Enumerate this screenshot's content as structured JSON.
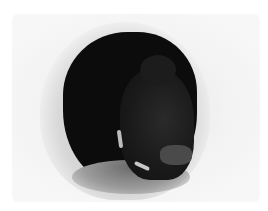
{
  "image": {
    "description": "Snow cave entrance with a dark interior and a person crouched inside",
    "colors": {
      "background": "#ffffff",
      "snow": "#f2f2f2",
      "snow_shadow": "#c8c8c8",
      "cave_interior": "#0c0c0c",
      "figure": "#1c1c1c"
    }
  }
}
